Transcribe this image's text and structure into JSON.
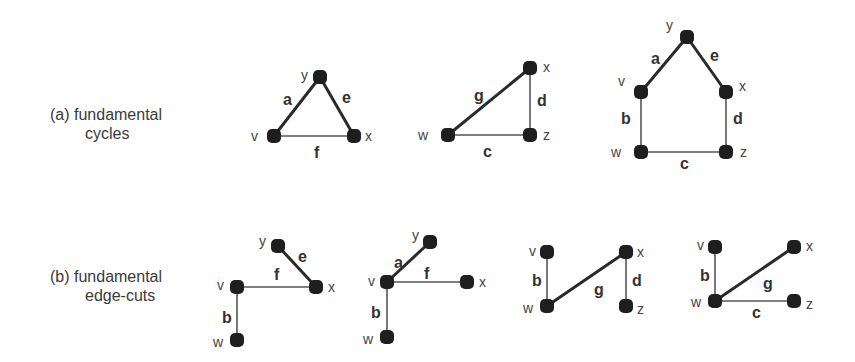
{
  "captions": {
    "a": {
      "line1": "(a) fundamental",
      "line2": "cycles"
    },
    "b": {
      "line1": "(b) fundamental",
      "line2": "edge-cuts"
    }
  },
  "colors": {
    "node": "#1e1e1e",
    "edge": "#2a2a2a",
    "text": "#3a3a3a",
    "background": "#ffffff"
  },
  "graphs": [
    {
      "id": "cycle-1",
      "row": "a",
      "nodes": [
        {
          "id": "y",
          "x": 320,
          "y": 77,
          "lx": 301,
          "ly": 80
        },
        {
          "id": "v",
          "x": 274,
          "y": 136,
          "lx": 251,
          "ly": 141
        },
        {
          "id": "x",
          "x": 354,
          "y": 136,
          "lx": 365,
          "ly": 141
        }
      ],
      "edges": [
        {
          "id": "a",
          "from": "y",
          "to": "v",
          "w": "thick",
          "lx": 283,
          "ly": 105
        },
        {
          "id": "e",
          "from": "y",
          "to": "x",
          "w": "thick",
          "lx": 342,
          "ly": 103
        },
        {
          "id": "f",
          "from": "v",
          "to": "x",
          "w": "thin",
          "lx": 314,
          "ly": 158
        }
      ]
    },
    {
      "id": "cycle-2",
      "row": "a",
      "nodes": [
        {
          "id": "x",
          "x": 530,
          "y": 68,
          "lx": 543,
          "ly": 72
        },
        {
          "id": "w",
          "x": 448,
          "y": 135,
          "lx": 418,
          "ly": 140
        },
        {
          "id": "z",
          "x": 530,
          "y": 135,
          "lx": 543,
          "ly": 140
        }
      ],
      "edges": [
        {
          "id": "g",
          "from": "x",
          "to": "w",
          "w": "thick",
          "lx": 474,
          "ly": 101
        },
        {
          "id": "d",
          "from": "x",
          "to": "z",
          "w": "thin",
          "lx": 537,
          "ly": 106
        },
        {
          "id": "c",
          "from": "w",
          "to": "z",
          "w": "thin",
          "lx": 483,
          "ly": 157
        }
      ]
    },
    {
      "id": "cycle-3",
      "row": "a",
      "nodes": [
        {
          "id": "y",
          "x": 687,
          "y": 37,
          "lx": 666,
          "ly": 30
        },
        {
          "id": "v",
          "x": 641,
          "y": 92,
          "lx": 618,
          "ly": 86
        },
        {
          "id": "x",
          "x": 726,
          "y": 92,
          "lx": 739,
          "ly": 91
        },
        {
          "id": "w",
          "x": 641,
          "y": 152,
          "lx": 611,
          "ly": 157
        },
        {
          "id": "z",
          "x": 726,
          "y": 152,
          "lx": 740,
          "ly": 157
        }
      ],
      "edges": [
        {
          "id": "a",
          "from": "y",
          "to": "v",
          "w": "thick",
          "lx": 651,
          "ly": 64
        },
        {
          "id": "e",
          "from": "y",
          "to": "x",
          "w": "thick",
          "lx": 710,
          "ly": 61
        },
        {
          "id": "b",
          "from": "v",
          "to": "w",
          "w": "thin",
          "lx": 621,
          "ly": 124
        },
        {
          "id": "d",
          "from": "x",
          "to": "z",
          "w": "thin",
          "lx": 733,
          "ly": 124
        },
        {
          "id": "c",
          "from": "w",
          "to": "z",
          "w": "thin",
          "lx": 680,
          "ly": 169
        }
      ]
    },
    {
      "id": "cut-1",
      "row": "b",
      "nodes": [
        {
          "id": "y",
          "x": 278,
          "y": 246,
          "lx": 259,
          "ly": 246
        },
        {
          "id": "x",
          "x": 316,
          "y": 287,
          "lx": 328,
          "ly": 292
        },
        {
          "id": "v",
          "x": 237,
          "y": 287,
          "lx": 217,
          "ly": 290
        },
        {
          "id": "w",
          "x": 237,
          "y": 340,
          "lx": 213,
          "ly": 347
        }
      ],
      "edges": [
        {
          "id": "e",
          "from": "y",
          "to": "x",
          "w": "thick",
          "lx": 298,
          "ly": 262
        },
        {
          "id": "f",
          "from": "v",
          "to": "x",
          "w": "thin",
          "lx": 274,
          "ly": 280
        },
        {
          "id": "b",
          "from": "v",
          "to": "w",
          "w": "thin",
          "lx": 222,
          "ly": 323
        }
      ]
    },
    {
      "id": "cut-2",
      "row": "b",
      "nodes": [
        {
          "id": "y",
          "x": 430,
          "y": 242,
          "lx": 412,
          "ly": 240
        },
        {
          "id": "v",
          "x": 387,
          "y": 282,
          "lx": 368,
          "ly": 286
        },
        {
          "id": "x",
          "x": 467,
          "y": 282,
          "lx": 479,
          "ly": 287
        },
        {
          "id": "w",
          "x": 387,
          "y": 337,
          "lx": 363,
          "ly": 344
        }
      ],
      "edges": [
        {
          "id": "a",
          "from": "y",
          "to": "v",
          "w": "thick",
          "lx": 394,
          "ly": 268
        },
        {
          "id": "f",
          "from": "v",
          "to": "x",
          "w": "thin",
          "lx": 424,
          "ly": 279
        },
        {
          "id": "b",
          "from": "v",
          "to": "w",
          "w": "thin",
          "lx": 371,
          "ly": 318
        }
      ]
    },
    {
      "id": "cut-3",
      "row": "b",
      "nodes": [
        {
          "id": "v",
          "x": 547,
          "y": 252,
          "lx": 529,
          "ly": 256
        },
        {
          "id": "x",
          "x": 626,
          "y": 252,
          "lx": 637,
          "ly": 257
        },
        {
          "id": "w",
          "x": 547,
          "y": 306,
          "lx": 523,
          "ly": 313
        },
        {
          "id": "z",
          "x": 626,
          "y": 306,
          "lx": 637,
          "ly": 314
        }
      ],
      "edges": [
        {
          "id": "b",
          "from": "v",
          "to": "w",
          "w": "thin",
          "lx": 532,
          "ly": 286
        },
        {
          "id": "g",
          "from": "x",
          "to": "w",
          "w": "thick",
          "lx": 594,
          "ly": 295
        },
        {
          "id": "d",
          "from": "x",
          "to": "z",
          "w": "thin",
          "lx": 632,
          "ly": 286
        }
      ]
    },
    {
      "id": "cut-4",
      "row": "b",
      "nodes": [
        {
          "id": "v",
          "x": 715,
          "y": 247,
          "lx": 697,
          "ly": 250
        },
        {
          "id": "x",
          "x": 794,
          "y": 247,
          "lx": 806,
          "ly": 251
        },
        {
          "id": "w",
          "x": 715,
          "y": 301,
          "lx": 691,
          "ly": 307
        },
        {
          "id": "z",
          "x": 794,
          "y": 301,
          "lx": 806,
          "ly": 309
        }
      ],
      "edges": [
        {
          "id": "b",
          "from": "v",
          "to": "w",
          "w": "thin",
          "lx": 700,
          "ly": 281
        },
        {
          "id": "g",
          "from": "x",
          "to": "w",
          "w": "thick",
          "lx": 763,
          "ly": 289
        },
        {
          "id": "c",
          "from": "w",
          "to": "z",
          "w": "thin",
          "lx": 752,
          "ly": 318
        }
      ]
    }
  ]
}
